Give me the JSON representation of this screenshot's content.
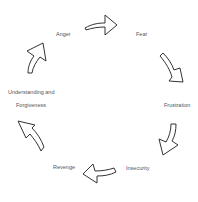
{
  "diagram": {
    "type": "cycle",
    "stages": [
      {
        "id": "anger",
        "label": "Anger"
      },
      {
        "id": "fear",
        "label": "Fear"
      },
      {
        "id": "frustration",
        "label": "Frustration"
      },
      {
        "id": "insecurity",
        "label": "Insecurity"
      },
      {
        "id": "revenge",
        "label": "Revenge"
      },
      {
        "id": "understanding",
        "label_line1": "Understanding and",
        "label_line2": "Forgiveness"
      }
    ],
    "arrows": [
      {
        "from": "Anger",
        "to": "Fear"
      },
      {
        "from": "Fear",
        "to": "Frustration"
      },
      {
        "from": "Frustration",
        "to": "Insecurity"
      },
      {
        "from": "Insecurity",
        "to": "Revenge"
      },
      {
        "from": "Revenge",
        "to": "Understanding and Forgiveness"
      },
      {
        "from": "Understanding and Forgiveness",
        "to": "Anger"
      }
    ],
    "colors": {
      "arrow_stroke": "#333333",
      "arrow_fill": "#ffffff",
      "text": "#555555",
      "background": "#ffffff"
    }
  }
}
